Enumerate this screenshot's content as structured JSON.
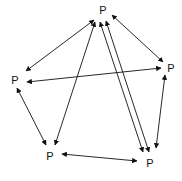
{
  "diagram": {
    "type": "graph",
    "colors": {
      "stroke": "#111111",
      "background": "#ffffff"
    },
    "nodes": [
      {
        "id": "top",
        "label": "P",
        "x": 103,
        "y": 14
      },
      {
        "id": "left",
        "label": "P",
        "x": 15,
        "y": 84
      },
      {
        "id": "right",
        "label": "P",
        "x": 171,
        "y": 72
      },
      {
        "id": "bottom-left",
        "label": "P",
        "x": 50,
        "y": 160
      },
      {
        "id": "bottom-right",
        "label": "P",
        "x": 150,
        "y": 167
      }
    ],
    "edges": [
      {
        "from": "top",
        "to": "left",
        "x1": 94,
        "y1": 20,
        "x2": 26,
        "y2": 71,
        "bidirectional": true
      },
      {
        "from": "top",
        "to": "right",
        "x1": 112,
        "y1": 15,
        "x2": 163,
        "y2": 62,
        "bidirectional": true
      },
      {
        "from": "top",
        "to": "bottom-left",
        "x1": 95,
        "y1": 22,
        "x2": 55,
        "y2": 145,
        "bidirectional": true
      },
      {
        "from": "top",
        "to": "bottom-right",
        "x1": 100,
        "y1": 22,
        "x2": 143,
        "y2": 152,
        "bidirectional": true
      },
      {
        "from": "top",
        "to": "bottom-right",
        "x1": 106,
        "y1": 21,
        "x2": 149,
        "y2": 152,
        "bidirectional": true
      },
      {
        "from": "left",
        "to": "right",
        "x1": 27,
        "y1": 82,
        "x2": 161,
        "y2": 68,
        "bidirectional": true
      },
      {
        "from": "left",
        "to": "bottom-left",
        "x1": 17,
        "y1": 88,
        "x2": 46,
        "y2": 145,
        "bidirectional": true
      },
      {
        "from": "right",
        "to": "bottom-right",
        "x1": 165,
        "y1": 75,
        "x2": 156,
        "y2": 148,
        "bidirectional": true
      },
      {
        "from": "bottom-left",
        "to": "bottom-right",
        "x1": 62,
        "y1": 154,
        "x2": 137,
        "y2": 161,
        "bidirectional": true
      }
    ]
  }
}
